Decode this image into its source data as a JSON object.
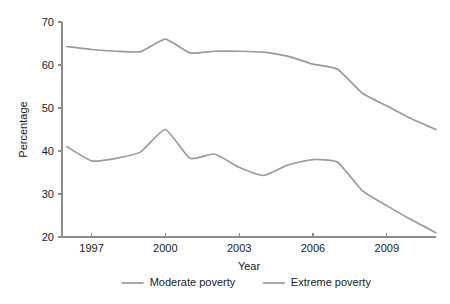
{
  "chart_data": {
    "type": "line",
    "title": "",
    "xlabel": "Year",
    "ylabel": "Percentage",
    "xlim": [
      1995.8,
      2011.0
    ],
    "ylim": [
      20,
      70
    ],
    "xticks": [
      1997,
      2000,
      2003,
      2006,
      2009
    ],
    "xtick_labels": [
      "1997",
      "2000",
      "2003",
      "2006",
      "2009"
    ],
    "yticks": [
      20,
      30,
      40,
      50,
      60,
      70
    ],
    "ytick_labels": [
      "20",
      "30",
      "40",
      "50",
      "60",
      "70"
    ],
    "grid": false,
    "legend_position": "bottom",
    "x": [
      1996,
      1997,
      1998,
      1999,
      2000,
      2001,
      2002,
      2003,
      2004,
      2005,
      2006,
      2007,
      2008,
      2009,
      2010,
      2011
    ],
    "series": [
      {
        "name": "Moderate poverty",
        "color": "#9a9a9a",
        "values": [
          64.3,
          63.6,
          63.2,
          63.1,
          66.0,
          62.8,
          63.2,
          63.2,
          63.0,
          62.0,
          60.2,
          59.0,
          53.5,
          50.5,
          47.5,
          45.0
        ]
      },
      {
        "name": "Extreme poverty",
        "color": "#9a9a9a",
        "values": [
          41.0,
          37.7,
          38.3,
          39.8,
          45.0,
          38.3,
          39.3,
          36.2,
          34.3,
          36.8,
          38.0,
          37.4,
          30.8,
          27.3,
          24.0,
          21.0
        ]
      }
    ]
  },
  "legend": {
    "items": [
      {
        "label": "Moderate poverty"
      },
      {
        "label": "Extreme poverty"
      }
    ]
  }
}
